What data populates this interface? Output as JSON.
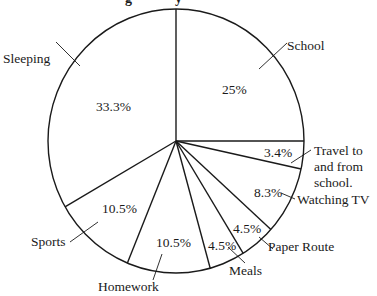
{
  "chart_data": {
    "type": "pie",
    "title": "",
    "title_note": "Title cut off at top edge; only descenders visible",
    "start_angle_deg": 0,
    "direction": "clockwise",
    "slices": [
      {
        "label": "School",
        "value": 25,
        "display": "25%"
      },
      {
        "label": "Travel to and from school.",
        "value": 3.4,
        "display": "3.4%"
      },
      {
        "label": "Watching TV",
        "value": 8.3,
        "display": "8.3%"
      },
      {
        "label": "Paper Route",
        "value": 4.5,
        "display": "4.5%"
      },
      {
        "label": "Meals",
        "value": 4.5,
        "display": "4.5%"
      },
      {
        "label": "Homework",
        "value": 10.5,
        "display": "10.5%"
      },
      {
        "label": "Sports",
        "value": 10.5,
        "display": "10.5%"
      },
      {
        "label": "Sleeping",
        "value": 33.3,
        "display": "33.3%"
      }
    ],
    "categories": [
      "School",
      "Travel to and from school.",
      "Watching TV",
      "Paper Route",
      "Meals",
      "Homework",
      "Sports",
      "Sleeping"
    ],
    "values": [
      25,
      3.4,
      8.3,
      4.5,
      4.5,
      10.5,
      10.5,
      33.3
    ],
    "legend": "none (leader-line labels)",
    "fill": "none",
    "stroke": "#1a1a1a"
  },
  "geometry": {
    "cx": 176,
    "cy": 141,
    "rx": 128,
    "ry": 132
  },
  "labels": {
    "school": "School",
    "travel_1": "Travel to",
    "travel_2": "and from",
    "travel_3": "school.",
    "watching_tv": "Watching TV",
    "paper_route": "Paper Route",
    "meals": "Meals",
    "homework": "Homework",
    "sports": "Sports",
    "sleeping": "Sleeping"
  },
  "percents": {
    "school": "25%",
    "travel": "3.4%",
    "watching_tv": "8.3%",
    "paper_route": "4.5%",
    "meals": "4.5%",
    "homework": "10.5%",
    "sports": "10.5%",
    "sleeping": "33.3%"
  }
}
